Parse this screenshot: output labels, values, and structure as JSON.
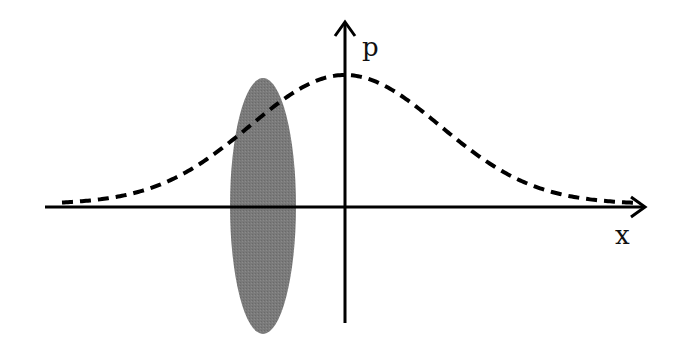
{
  "diagram": {
    "type": "phase-space sketch",
    "axes": {
      "x_label": "x",
      "y_label": "p",
      "origin": [
        345,
        207
      ]
    },
    "curve": {
      "description": "Gaussian distribution (dashed)",
      "style": "dashed",
      "peak": [
        345,
        75
      ],
      "baseline_y": 207,
      "sigma_px": 95
    },
    "ellipse": {
      "description": "Gray filled vertical ellipse",
      "center": [
        263,
        206
      ],
      "rx": 33,
      "ry": 128,
      "fill": "#7a7a7a"
    },
    "colors": {
      "stroke": "#000000",
      "ellipse_fill": "#7a7a7a",
      "background": "#ffffff"
    }
  }
}
